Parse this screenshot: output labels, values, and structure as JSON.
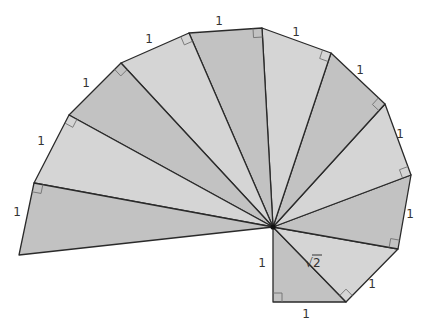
{
  "diagram": {
    "center": [
      273,
      227
    ],
    "colors": {
      "dark_fill": "#c2c2c2",
      "light_fill": "#d5d5d5",
      "stroke": "#2a2a2a",
      "right_angle_stroke": "#707070",
      "background": "#ffffff"
    },
    "outer_vertices": [
      [
        273,
        302
      ],
      [
        346,
        302
      ],
      [
        398,
        249
      ],
      [
        411,
        175
      ],
      [
        385,
        104
      ],
      [
        331,
        53
      ],
      [
        262,
        28
      ],
      [
        189,
        33
      ],
      [
        121,
        63
      ],
      [
        69,
        115
      ],
      [
        34,
        183
      ],
      [
        19,
        255
      ]
    ],
    "first_leg_start": [
      273,
      227
    ],
    "labels": [
      {
        "text": "1",
        "x": 262,
        "y": 267,
        "name": "label-leg-vertical"
      },
      {
        "text": "1",
        "x": 306,
        "y": 318,
        "name": "label-leg-bottom"
      },
      {
        "text": "√2",
        "x": 313,
        "y": 267,
        "name": "label-hypotenuse-sqrt2"
      },
      {
        "text": "1",
        "x": 372,
        "y": 288,
        "name": "label-side-2"
      },
      {
        "text": "1",
        "x": 410,
        "y": 218,
        "name": "label-side-3"
      },
      {
        "text": "1",
        "x": 400,
        "y": 138,
        "name": "label-side-4"
      },
      {
        "text": "1",
        "x": 360,
        "y": 74,
        "name": "label-side-5"
      },
      {
        "text": "1",
        "x": 296,
        "y": 36,
        "name": "label-side-6"
      },
      {
        "text": "1",
        "x": 219,
        "y": 25,
        "name": "label-side-7"
      },
      {
        "text": "1",
        "x": 149,
        "y": 43,
        "name": "label-side-8"
      },
      {
        "text": "1",
        "x": 86,
        "y": 87,
        "name": "label-side-9"
      },
      {
        "text": "1",
        "x": 41,
        "y": 145,
        "name": "label-side-10"
      },
      {
        "text": "1",
        "x": 17,
        "y": 216,
        "name": "label-side-11"
      }
    ]
  }
}
